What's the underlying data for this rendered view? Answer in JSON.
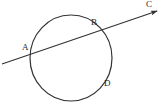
{
  "figure": {
    "background_color": "#ffffff",
    "stroke_color": "#333333",
    "label_color": "#2a2a2a"
  },
  "labels": {
    "a": "A",
    "b": "B",
    "c": "C",
    "d": "D"
  },
  "chart_data": {
    "type": "diagram",
    "shapes": [
      {
        "kind": "circle",
        "name": "circle",
        "center": [
          71,
          58
        ],
        "radius_x": 41,
        "radius_y": 43,
        "stroke": "#333333",
        "fill": "none",
        "stroke_width": 1.2
      },
      {
        "kind": "line",
        "name": "secant-line",
        "from": [
          2,
          64
        ],
        "to": [
          160,
          10
        ],
        "stroke": "#333333",
        "stroke_width": 1.2,
        "arrow_at": "to"
      }
    ],
    "points": [
      {
        "label": "A",
        "at": [
          31,
          55
        ],
        "on": "circle-and-line",
        "label_at": [
          22,
          43
        ]
      },
      {
        "label": "B",
        "at": [
          98,
          31
        ],
        "on": "circle-and-line",
        "label_at": [
          91,
          18
        ]
      },
      {
        "label": "C",
        "at": [
          160,
          10
        ],
        "on": "line-arrow-tip",
        "label_at": [
          146,
          0
        ]
      },
      {
        "label": "D",
        "at": [
          101,
          80
        ],
        "on": "circle",
        "label_at": [
          104,
          79
        ]
      }
    ]
  }
}
